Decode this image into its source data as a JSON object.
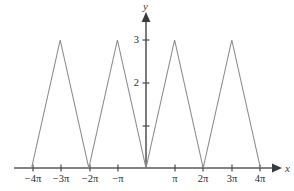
{
  "figure": {
    "background_color": "#ffffff",
    "curve_color": "#8c8c8c",
    "axis_color": "#5a5a5a",
    "text_color": "#2b2b2b"
  },
  "axes": {
    "x_axis_label": "x",
    "y_axis_label": "y",
    "x_ticks": [
      {
        "label": "−4π",
        "value": -12.566
      },
      {
        "label": "−3π",
        "value": -9.425
      },
      {
        "label": "−2π",
        "value": -6.283
      },
      {
        "label": "−π",
        "value": -3.142
      },
      {
        "label": "π",
        "value": 3.142
      },
      {
        "label": "2π",
        "value": 6.283
      },
      {
        "label": "3π",
        "value": 9.425
      },
      {
        "label": "4π",
        "value": 12.566
      }
    ],
    "y_ticks": [
      {
        "label": "",
        "value": 1
      },
      {
        "label": "2",
        "value": 2
      },
      {
        "label": "3",
        "value": 3
      }
    ]
  },
  "chart_data": {
    "type": "line",
    "title": "",
    "xlabel": "x",
    "ylabel": "y",
    "xlim": [
      -13.6,
      14.1
    ],
    "ylim": [
      0,
      3.45
    ],
    "grid": false,
    "legend": null,
    "x_tick_labels": [
      "−4π",
      "−3π",
      "−2π",
      "−π",
      "π",
      "2π",
      "3π",
      "4π"
    ],
    "y_tick_labels": [
      "2",
      "3"
    ],
    "series": [
      {
        "name": "triangle wave",
        "color": "#8c8c8c",
        "x": [
          -12.566,
          -9.425,
          -6.283,
          -3.142,
          0,
          3.142,
          6.283,
          9.425,
          12.566
        ],
        "y": [
          0,
          3,
          0,
          3,
          0,
          3,
          0,
          3,
          0
        ]
      }
    ]
  }
}
